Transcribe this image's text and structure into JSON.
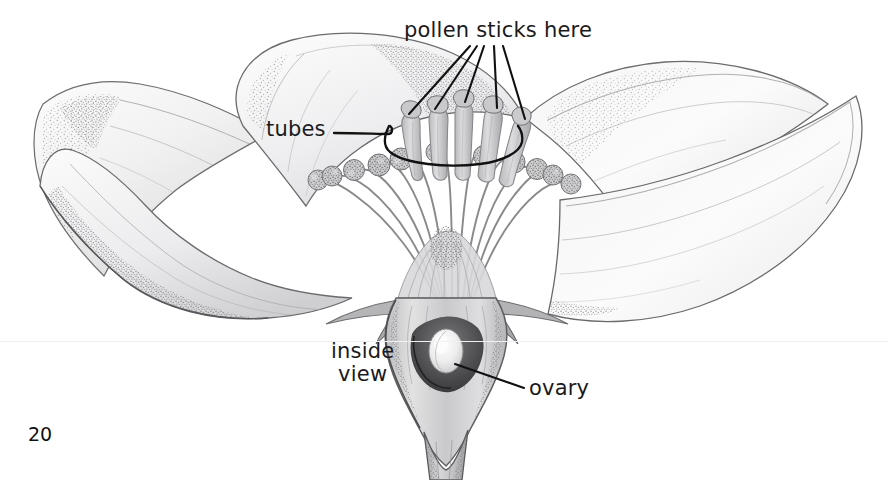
{
  "page": {
    "number": "20",
    "background_color": "#ffffff",
    "ink_color": "#1a1a1a",
    "width": 889,
    "height": 480
  },
  "illustration": {
    "title": "flower-inside-view",
    "subject": "flower cut-away botanical pencil drawing",
    "style": "graphite pencil shading with stippling",
    "parts": [
      "petals",
      "stamens",
      "anthers",
      "styles",
      "sepals",
      "receptacle",
      "ovary",
      "stem"
    ]
  },
  "labels": {
    "pollen": "pollen sticks here",
    "tubes": "tubes",
    "inside_line1": "inside",
    "inside_line2": "view",
    "ovary": "ovary"
  },
  "leaders": {
    "pollen_target_count": 5,
    "tubes_target": "style-bracket-arc",
    "ovary_target": "ovary-body"
  }
}
